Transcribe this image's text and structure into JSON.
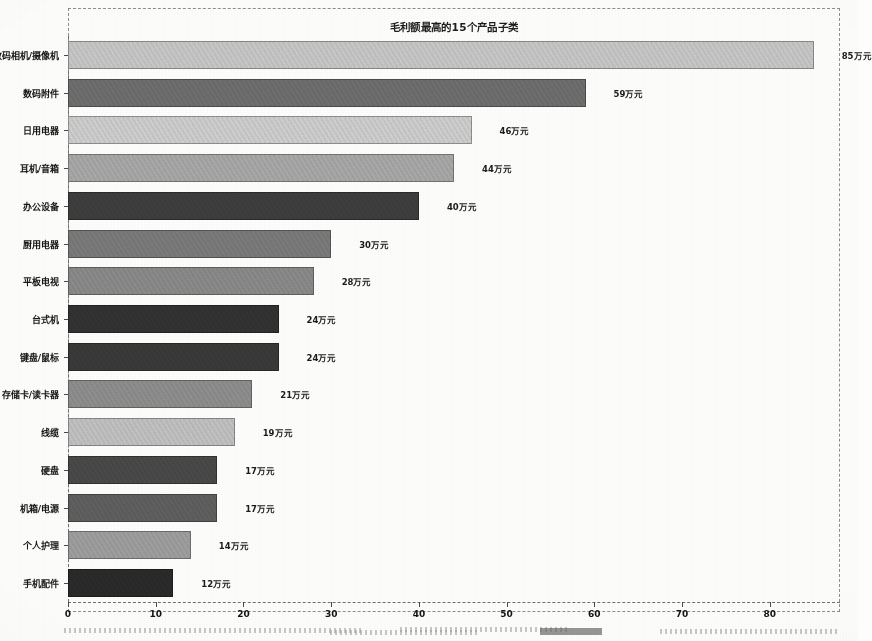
{
  "chart_data": {
    "type": "bar",
    "orientation": "horizontal",
    "title": "毛利额最高的15个产品子类",
    "xlabel": "",
    "ylabel": "",
    "xlim": [
      0,
      88
    ],
    "ylim": [
      0,
      15
    ],
    "grid": false,
    "legend": null,
    "unit_suffix": "万元",
    "xticks": [
      "0",
      "10",
      "20",
      "30",
      "40",
      "50",
      "60",
      "70",
      "80"
    ],
    "xtick_values": [
      0,
      10,
      20,
      30,
      40,
      50,
      60,
      70,
      80
    ],
    "categories": [
      "数码相机/摄像机",
      "数码附件",
      "日用电器",
      "耳机/音箱",
      "办公设备",
      "厨用电器",
      "平板电视",
      "台式机",
      "键盘/鼠标",
      "存储卡/读卡器",
      "线缆",
      "硬盘",
      "机箱/电源",
      "个人护理",
      "手机配件"
    ],
    "values": [
      85,
      59,
      46,
      44,
      40,
      30,
      28,
      24,
      24,
      21,
      19,
      17,
      17,
      14,
      12
    ],
    "data_labels": [
      "85万元",
      "59万元",
      "46万元",
      "44万元",
      "40万元",
      "30万元",
      "28万元",
      "24万元",
      "24万元",
      "21万元",
      "19万元",
      "17万元",
      "17万元",
      "14万元",
      "12万元"
    ],
    "bar_colors": [
      "#c8c8c8",
      "#6f6f6f",
      "#cfcfcf",
      "#a9a9a9",
      "#3e3e3e",
      "#7b7b7b",
      "#8b8b8b",
      "#333333",
      "#3a3a3a",
      "#8f8f8f",
      "#c2c2c2",
      "#4a4a4a",
      "#606060",
      "#9f9f9f",
      "#2b2b2b"
    ],
    "bar_textures": [
      "plain",
      "plain",
      "plain",
      "plain",
      "plain",
      "plain",
      "plain",
      "plain",
      "plain",
      "plain",
      "plain",
      "plain",
      "plain",
      "plain",
      "dots"
    ]
  },
  "artifacts": {
    "note_left": "",
    "note_mid": "",
    "note_right": ""
  }
}
